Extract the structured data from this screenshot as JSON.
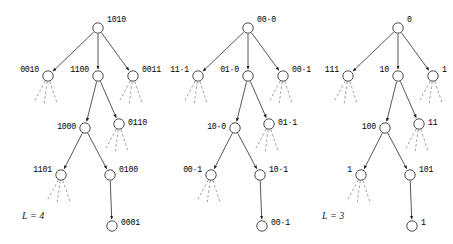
{
  "figure": {
    "background_color": "#ffffff",
    "edge_color": "#2b2b2b",
    "dashed_edge_color": "#8a8a8a",
    "node_fill": "#ffffff"
  },
  "trees": [
    {
      "id": "tree-1",
      "level_label": "L = 4",
      "root": {
        "label": "1010"
      },
      "level2": [
        {
          "label": "0010",
          "side": "left"
        },
        {
          "label": "1100",
          "side": "middle"
        },
        {
          "label": "0011",
          "side": "right"
        }
      ],
      "level3": [
        {
          "label": "1000",
          "side": "left"
        },
        {
          "label": "0110",
          "side": "right"
        }
      ],
      "level4": [
        {
          "label": "1101",
          "side": "left"
        },
        {
          "label": "0100",
          "side": "right"
        }
      ],
      "leaf": {
        "label": "0001"
      }
    },
    {
      "id": "tree-2",
      "level_label": "",
      "root": {
        "label": "00·0"
      },
      "level2": [
        {
          "label": "11·1",
          "side": "left"
        },
        {
          "label": "01·0",
          "side": "middle"
        },
        {
          "label": "00·1",
          "side": "right"
        }
      ],
      "level3": [
        {
          "label": "10·0",
          "side": "left"
        },
        {
          "label": "01·1",
          "side": "right"
        }
      ],
      "level4": [
        {
          "label": "00·1",
          "side": "left"
        },
        {
          "label": "10·1",
          "side": "right"
        }
      ],
      "leaf": {
        "label": "00·1"
      }
    },
    {
      "id": "tree-3",
      "level_label": "L = 3",
      "root": {
        "label": "0"
      },
      "level2": [
        {
          "label": "111",
          "side": "left"
        },
        {
          "label": "10",
          "side": "middle"
        },
        {
          "label": "1",
          "side": "right"
        }
      ],
      "level3": [
        {
          "label": "100",
          "side": "left"
        },
        {
          "label": "11",
          "side": "right"
        }
      ],
      "level4": [
        {
          "label": "1",
          "side": "left"
        },
        {
          "label": "101",
          "side": "right"
        }
      ],
      "leaf": {
        "label": "1"
      }
    }
  ]
}
